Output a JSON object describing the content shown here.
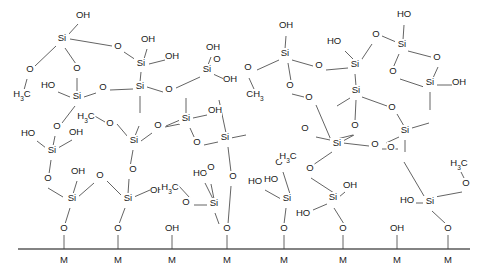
{
  "figure": {
    "type": "chemical-structure-diagram",
    "colors": {
      "background": "#ffffff",
      "bond": "#3c3c3c",
      "label": "#1a1a1a",
      "surface": "#5a5a5a"
    }
  },
  "labels": {
    "si": "Si",
    "o": "O",
    "oh": "OH",
    "ho": "HO",
    "h3c": "H",
    "h3c_sub": "3",
    "h3c_tail": "C",
    "ch3": "CH",
    "ch3_sub": "3",
    "m": "M"
  },
  "atoms": [
    {
      "id": "si1",
      "kind": "Si",
      "text": "Si",
      "x": 62,
      "y": 41
    },
    {
      "id": "si2",
      "kind": "Si",
      "text": "Si",
      "x": 141,
      "y": 66
    },
    {
      "id": "si3",
      "kind": "Si",
      "text": "Si",
      "x": 140,
      "y": 89
    },
    {
      "id": "si4",
      "kind": "Si",
      "text": "Si",
      "x": 207,
      "y": 72
    },
    {
      "id": "si5",
      "kind": "Si",
      "text": "Si",
      "x": 77,
      "y": 99
    },
    {
      "id": "si6",
      "kind": "Si",
      "text": "Si",
      "x": 186,
      "y": 121
    },
    {
      "id": "si7",
      "kind": "Si",
      "text": "Si",
      "x": 134,
      "y": 143
    },
    {
      "id": "si8",
      "kind": "Si",
      "text": "Si",
      "x": 52,
      "y": 153
    },
    {
      "id": "si9",
      "kind": "Si",
      "text": "Si",
      "x": 72,
      "y": 201
    },
    {
      "id": "si10",
      "kind": "Si",
      "text": "Si",
      "x": 128,
      "y": 201
    },
    {
      "id": "si11",
      "kind": "Si",
      "text": "Si",
      "x": 214,
      "y": 206
    },
    {
      "id": "si12",
      "kind": "Si",
      "text": "Si",
      "x": 225,
      "y": 140
    },
    {
      "id": "si13",
      "kind": "Si",
      "text": "Si",
      "x": 285,
      "y": 56
    },
    {
      "id": "si14",
      "kind": "Si",
      "text": "Si",
      "x": 355,
      "y": 67
    },
    {
      "id": "si15",
      "kind": "Si",
      "text": "Si",
      "x": 356,
      "y": 93
    },
    {
      "id": "si16",
      "kind": "Si",
      "text": "Si",
      "x": 402,
      "y": 47
    },
    {
      "id": "si17",
      "kind": "Si",
      "text": "Si",
      "x": 430,
      "y": 85
    },
    {
      "id": "si18",
      "kind": "Si",
      "text": "Si",
      "x": 337,
      "y": 146
    },
    {
      "id": "si19",
      "kind": "Si",
      "text": "Si",
      "x": 287,
      "y": 201
    },
    {
      "id": "si20",
      "kind": "Si",
      "text": "Si",
      "x": 333,
      "y": 200
    },
    {
      "id": "si21",
      "kind": "Si",
      "text": "Si",
      "x": 405,
      "y": 133
    },
    {
      "id": "si22",
      "kind": "Si",
      "text": "Si",
      "x": 430,
      "y": 204
    }
  ],
  "oxygens": [
    {
      "id": "o1",
      "x": 83,
      "y": 18,
      "text": "OH"
    },
    {
      "id": "o2",
      "x": 30,
      "y": 72,
      "text": "O"
    },
    {
      "id": "o3",
      "x": 22,
      "y": 97,
      "text": "H3C"
    },
    {
      "id": "o4",
      "x": 77,
      "y": 71,
      "text": "O"
    },
    {
      "id": "o5",
      "x": 118,
      "y": 49,
      "text": "O"
    },
    {
      "id": "o6",
      "x": 148,
      "y": 42,
      "text": "OH"
    },
    {
      "id": "o7",
      "x": 172,
      "y": 59,
      "text": "OH"
    },
    {
      "id": "o8",
      "x": 103,
      "y": 90,
      "text": "O"
    },
    {
      "id": "o9",
      "x": 48,
      "y": 88,
      "text": "HO"
    },
    {
      "id": "o10",
      "x": 213,
      "y": 50,
      "text": "OH"
    },
    {
      "id": "o11",
      "x": 230,
      "y": 82,
      "text": "OH"
    },
    {
      "id": "o12",
      "x": 169,
      "y": 92,
      "text": "O"
    },
    {
      "id": "o13",
      "x": 158,
      "y": 128,
      "text": "O"
    },
    {
      "id": "o14",
      "x": 215,
      "y": 113,
      "text": "OH"
    },
    {
      "id": "o15",
      "x": 197,
      "y": 145,
      "text": "O"
    },
    {
      "id": "o16",
      "x": 110,
      "y": 126,
      "text": "O"
    },
    {
      "id": "o17",
      "x": 86,
      "y": 119,
      "text": "H3C"
    },
    {
      "id": "o18",
      "x": 57,
      "y": 129,
      "text": "O"
    },
    {
      "id": "o19",
      "x": 28,
      "y": 136,
      "text": "HO"
    },
    {
      "id": "o20",
      "x": 76,
      "y": 135,
      "text": "OH"
    },
    {
      "id": "o21",
      "x": 48,
      "y": 181,
      "text": "O"
    },
    {
      "id": "o22",
      "x": 78,
      "y": 174,
      "text": "OH"
    },
    {
      "id": "o23",
      "x": 100,
      "y": 178,
      "text": "O"
    },
    {
      "id": "o24",
      "x": 133,
      "y": 172,
      "text": "O"
    },
    {
      "id": "o25",
      "x": 157,
      "y": 193,
      "text": "OH"
    },
    {
      "id": "o26",
      "x": 170,
      "y": 190,
      "text": "H3C"
    },
    {
      "id": "o27",
      "x": 200,
      "y": 176,
      "text": "HO"
    },
    {
      "id": "o28",
      "x": 186,
      "y": 205,
      "text": "O"
    },
    {
      "id": "o29",
      "x": 233,
      "y": 179,
      "text": "O"
    },
    {
      "id": "o30",
      "x": 211,
      "y": 170,
      "text": "O"
    },
    {
      "id": "o31",
      "x": 248,
      "y": 70,
      "text": "O"
    },
    {
      "id": "o32",
      "x": 255,
      "y": 97,
      "text": "CH3"
    },
    {
      "id": "o33",
      "x": 286,
      "y": 28,
      "text": "OH"
    },
    {
      "id": "o34",
      "x": 319,
      "y": 68,
      "text": "O"
    },
    {
      "id": "o35",
      "x": 290,
      "y": 88,
      "text": "O"
    },
    {
      "id": "o36",
      "x": 334,
      "y": 44,
      "text": "HO"
    },
    {
      "id": "o37",
      "x": 376,
      "y": 37,
      "text": "O"
    },
    {
      "id": "o38",
      "x": 404,
      "y": 17,
      "text": "HO"
    },
    {
      "id": "o39",
      "x": 437,
      "y": 60,
      "text": "O"
    },
    {
      "id": "o40",
      "x": 393,
      "y": 74,
      "text": "O"
    },
    {
      "id": "o41",
      "x": 459,
      "y": 85,
      "text": "OH"
    },
    {
      "id": "o42",
      "x": 309,
      "y": 100,
      "text": "O"
    },
    {
      "id": "o43",
      "x": 355,
      "y": 128,
      "text": "O"
    },
    {
      "id": "o44",
      "x": 392,
      "y": 110,
      "text": "O"
    },
    {
      "id": "o45",
      "x": 305,
      "y": 131,
      "text": "O"
    },
    {
      "id": "o46",
      "x": 375,
      "y": 147,
      "text": "O"
    },
    {
      "id": "o47",
      "x": 271,
      "y": 182,
      "text": "HO"
    },
    {
      "id": "o48",
      "x": 310,
      "y": 171,
      "text": "O"
    },
    {
      "id": "o49",
      "x": 350,
      "y": 188,
      "text": "OH"
    },
    {
      "id": "o50",
      "x": 303,
      "y": 216,
      "text": "HO"
    },
    {
      "id": "o51",
      "x": 255,
      "y": 184,
      "text": "HO"
    },
    {
      "id": "o52",
      "x": 279,
      "y": 165,
      "text": "O"
    },
    {
      "id": "o53",
      "x": 288,
      "y": 159,
      "text": "H3C"
    },
    {
      "id": "o54",
      "x": 391,
      "y": 150,
      "text": "O"
    },
    {
      "id": "o55",
      "x": 459,
      "y": 166,
      "text": "H3C"
    },
    {
      "id": "o56",
      "x": 466,
      "y": 186,
      "text": "O"
    },
    {
      "id": "o57",
      "x": 407,
      "y": 203,
      "text": "HO"
    },
    {
      "id": "o58",
      "x": 217,
      "y": 62,
      "text": "O"
    }
  ],
  "surface": {
    "line_label": "metal-oxide-surface",
    "anchors": [
      {
        "x": 64,
        "top_label": "O",
        "m_label": "M"
      },
      {
        "x": 118,
        "top_label": "O",
        "m_label": "M"
      },
      {
        "x": 172,
        "top_label": "OH",
        "m_label": "M"
      },
      {
        "x": 227,
        "top_label": "O",
        "m_label": "M"
      },
      {
        "x": 284,
        "top_label": "O",
        "m_label": "M"
      },
      {
        "x": 343,
        "top_label": "O",
        "m_label": "M"
      },
      {
        "x": 397,
        "top_label": "OH",
        "m_label": "M"
      },
      {
        "x": 448,
        "top_label": "O",
        "m_label": "M"
      }
    ],
    "baseline_y": 249,
    "m_label_y": 263,
    "top_label_y": 231
  }
}
